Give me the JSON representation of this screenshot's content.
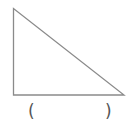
{
  "figure": {
    "shape": "right-triangle",
    "stroke_color": "#8a8a8a",
    "vertices": {
      "top_left": [
        13.5,
        8.5
      ],
      "bottom_left": [
        13.5,
        95
      ],
      "bottom_right": [
        124,
        95
      ]
    }
  },
  "answer_blank": {
    "open": "(",
    "close": ")",
    "value": ""
  }
}
